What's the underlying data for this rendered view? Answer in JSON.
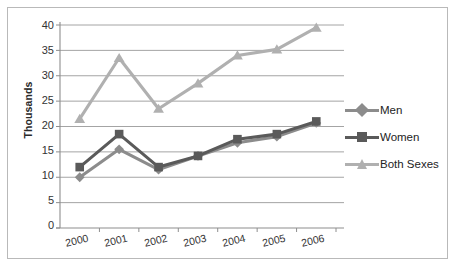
{
  "chart_data": {
    "type": "line",
    "title": "",
    "subtitle": "",
    "xlabel": "",
    "ylabel": "Thousands",
    "categories": [
      "2000",
      "2001",
      "2002",
      "2003",
      "2004",
      "2005",
      "2006"
    ],
    "x": [
      2000,
      2001,
      2002,
      2003,
      2004,
      2005,
      2006
    ],
    "ylim": [
      0,
      40
    ],
    "yticks": [
      0,
      5,
      10,
      15,
      20,
      25,
      30,
      35,
      40
    ],
    "ytick_labels": [
      "0",
      "5",
      "10",
      "15",
      "20",
      "25",
      "30",
      "35",
      "40"
    ],
    "grid": "horizontal",
    "legend_position": "right",
    "series": [
      {
        "name": "Men",
        "marker": "diamond",
        "color": "#8c8c8c",
        "values": [
          10,
          15.5,
          11.5,
          14.2,
          16.8,
          18,
          20.7
        ]
      },
      {
        "name": "Women",
        "marker": "square",
        "color": "#5a5a5a",
        "values": [
          12,
          18.5,
          12,
          14.2,
          17.5,
          18.5,
          21
        ]
      },
      {
        "name": "Both Sexes",
        "marker": "triangle",
        "color": "#b0b0b0",
        "values": [
          21.5,
          33.5,
          23.5,
          28.5,
          34,
          35.2,
          39.5
        ]
      }
    ]
  },
  "axis": {
    "y_title": "Thousands",
    "y_labels": [
      "40",
      "35",
      "30",
      "25",
      "20",
      "15",
      "10",
      "5",
      "0"
    ],
    "x_labels": [
      "2000",
      "2001",
      "2002",
      "2003",
      "2004",
      "2005",
      "2006"
    ]
  },
  "legend": {
    "items": [
      {
        "label": "Men",
        "color": "#8c8c8c",
        "marker": "diamond"
      },
      {
        "label": "Women",
        "color": "#5a5a5a",
        "marker": "square"
      },
      {
        "label": "Both Sexes",
        "color": "#b0b0b0",
        "marker": "triangle"
      }
    ]
  },
  "colors": {
    "men": "#8c8c8c",
    "women": "#5a5a5a",
    "both_sexes": "#b0b0b0",
    "gridline": "#9a9a9a",
    "axis": "#8e8e8e",
    "text": "#333333",
    "frame": "#b9b9b9",
    "background": "#ffffff"
  }
}
